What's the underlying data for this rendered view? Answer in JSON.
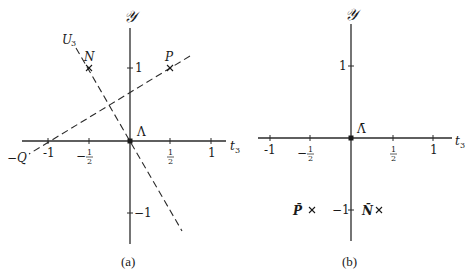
{
  "panels": {
    "a": {
      "caption": "(a)",
      "y_axis_label": "𝒴",
      "x_axis_label": "t",
      "x_axis_subscript": "3",
      "origin_label": "Λ",
      "x_ticks": {
        "neg1": "-1",
        "neg_half_sign": "−",
        "half_num": "1",
        "half_den": "2",
        "pos1": "1"
      },
      "y_ticks": {
        "pos1": "1",
        "neg1": "−1"
      },
      "points": {
        "N": "N",
        "P": "P",
        "negQ": "−Q",
        "U3": "U",
        "U3_sub": "3"
      },
      "marker": "×"
    },
    "b": {
      "caption": "(b)",
      "y_axis_label": "𝒴",
      "x_axis_label": "t",
      "x_axis_subscript": "3",
      "origin_label": "Λ̄",
      "x_ticks": {
        "neg1": "-1",
        "neg_half_sign": "−",
        "half_num": "1",
        "half_den": "2",
        "pos1": "1"
      },
      "y_ticks": {
        "pos1": "1",
        "neg1": "−1"
      },
      "points": {
        "Pbar": "P̄",
        "Nbar": "N̄"
      },
      "marker": "×"
    }
  }
}
